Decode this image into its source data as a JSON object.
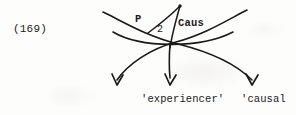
{
  "page": {
    "example_number": "(169)",
    "ink_color": "#1a1a1a",
    "background_color": "#fdfdfc"
  },
  "diagram": {
    "type": "linguistic-arc-diagram",
    "node_labels": {
      "p": "P",
      "index": "2",
      "caus": "Caus"
    },
    "role_labels": {
      "experiencer": "'experiencer'",
      "causal": "'causal"
    },
    "arrows": [
      {
        "name": "left-arrow",
        "target_role": ""
      },
      {
        "name": "middle-arrow",
        "target_role": "'experiencer'"
      },
      {
        "name": "right-arrow",
        "target_role": "'causal"
      }
    ],
    "arcs": [
      {
        "name": "upper-left-arc"
      },
      {
        "name": "upper-right-arc"
      },
      {
        "name": "lower-arc"
      },
      {
        "name": "apex-spoke"
      }
    ]
  }
}
